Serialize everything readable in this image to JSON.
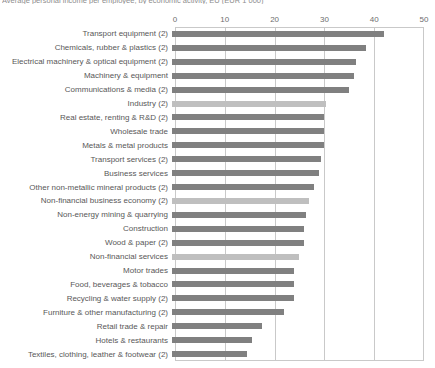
{
  "chart_data": {
    "type": "bar",
    "orientation": "horizontal",
    "title": "Average personal income per employee, by economic activity, EU (EUR 1 000)",
    "xlabel": "",
    "ylabel": "",
    "xlim": [
      0,
      50
    ],
    "xticks": [
      0,
      10,
      20,
      30,
      40,
      50
    ],
    "grid": true,
    "legend": "none",
    "colors": {
      "bar_default": "#808080",
      "bar_highlight": "#bfbfbf",
      "axis": "#c9c9c9",
      "text": "#585858"
    },
    "categories": [
      "Transport equipment (2)",
      "Chemicals, rubber & plastics (2)",
      "Electrical machinery & optical equipment (2)",
      "Machinery & equipment",
      "Communications & media (2)",
      "Industry (2)",
      "Real estate, renting & R&D (2)",
      "Wholesale trade",
      "Metals & metal products",
      "Transport services (2)",
      "Business services",
      "Other non-metallic mineral products (2)",
      "Non-financial business economy (2)",
      "Non-energy mining & quarrying",
      "Construction",
      "Wood & paper (2)",
      "Non-financial services",
      "Motor trades",
      "Food, beverages & tobacco",
      "Recycling & water supply (2)",
      "Furniture & other manufacturing (2)",
      "Retail trade & repair",
      "Hotels & restaurants",
      "Textiles, clothing, leather & footwear (2)"
    ],
    "values": [
      42.5,
      39.0,
      37.0,
      36.5,
      35.5,
      31.0,
      30.5,
      30.5,
      30.5,
      30.0,
      29.5,
      28.5,
      27.5,
      27.0,
      26.5,
      26.5,
      25.5,
      24.5,
      24.5,
      24.5,
      22.5,
      18.0,
      16.0,
      15.0
    ],
    "highlighted": [
      "Industry (2)",
      "Non-financial business economy (2)",
      "Non-financial services"
    ]
  }
}
